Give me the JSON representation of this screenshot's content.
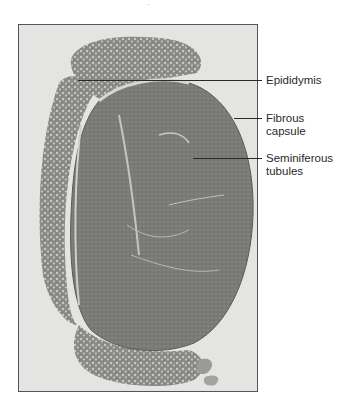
{
  "figure": {
    "labels": [
      {
        "id": "epididymis",
        "text": "Epididymis",
        "lines": [
          "Epididymis"
        ]
      },
      {
        "id": "fibrous-capsule",
        "text": "Fibrous capsule",
        "lines": [
          "Fibrous",
          "capsule"
        ]
      },
      {
        "id": "seminiferous-tubules",
        "text": "Seminiferous tubules",
        "lines": [
          "Seminiferous",
          "tubules"
        ]
      }
    ],
    "colors": {
      "background": "#ffffff",
      "photo_background": "#e4e4e2",
      "tissue_dark": "#6e6e6e",
      "tissue_mid": "#8c8c8a",
      "tissue_light": "#b4b4b2",
      "label_text": "#2a2a2a"
    }
  }
}
